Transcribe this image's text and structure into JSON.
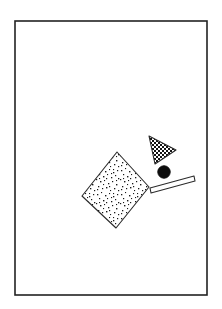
{
  "figure": {
    "canvas": {
      "width": 222,
      "height": 309,
      "background": "#ffffff"
    },
    "frame": {
      "name": "border-frame",
      "x": 15,
      "y": 21,
      "width": 192,
      "height": 274,
      "stroke": "#222222",
      "stroke_width": 1.6,
      "fill": "none"
    },
    "shapes": [
      {
        "id": "speckled-rectangle",
        "type": "rotated-rectangle",
        "fill_pattern": "stipple",
        "fill_color": "#ffffff",
        "dot_color": "#1a1a1a",
        "stroke": "#2b2b2b",
        "stroke_width": 1.1,
        "points": "117,152 149,187 116,228 82,196",
        "rotation_deg": 47
      },
      {
        "id": "checkered-triangle",
        "type": "triangle",
        "fill_pattern": "checkerboard",
        "fill_color": "#ffffff",
        "check_color": "#1a1a1a",
        "check_size": 2,
        "stroke": "#2b2b2b",
        "stroke_width": 1.1,
        "points": "149,136 176,150 155,164"
      },
      {
        "id": "black-circle",
        "type": "circle",
        "fill_pattern": "solid",
        "fill_color": "#0d0d0d",
        "stroke": "#0d0d0d",
        "stroke_width": 1,
        "cx": 164,
        "cy": 172,
        "r": 6.2
      },
      {
        "id": "white-bar",
        "type": "thin-bar",
        "fill_pattern": "solid",
        "fill_color": "#ffffff",
        "stroke": "#2b2b2b",
        "stroke_width": 1.1,
        "points": "150,188 194,176 195,181 151,193"
      }
    ]
  }
}
